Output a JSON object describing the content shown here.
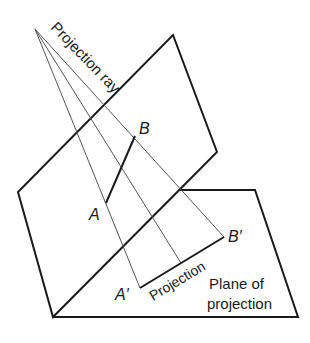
{
  "diagram": {
    "colors": {
      "stroke": "#1a1a1a",
      "ray": "#555555",
      "background": "#ffffff"
    },
    "labels": {
      "projection_ray": "Projection ray",
      "point_a": "A",
      "point_b": "B",
      "point_a_prime": "A′",
      "point_b_prime": "B′",
      "projection": "Projection",
      "plane_line1": "Plane of",
      "plane_line2": "projection"
    },
    "points": {
      "apex": [
        35,
        29
      ],
      "A": [
        106,
        203
      ],
      "B": [
        135,
        136
      ],
      "A_prime": [
        140,
        288
      ],
      "B_prime": [
        224,
        237
      ],
      "mid_projection": [
        181,
        263
      ]
    }
  }
}
